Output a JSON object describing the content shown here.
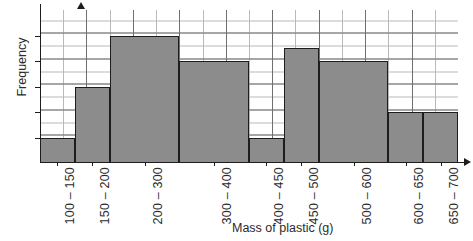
{
  "chart_data": {
    "type": "bar",
    "title": "",
    "subtitle": "",
    "xlabel": "Mass of plastic (g)",
    "ylabel": "Frequency",
    "categories": [
      "100 – 150",
      "150 – 200",
      "200 – 300",
      "300 – 400",
      "400 – 450",
      "450 – 500",
      "500 – 600",
      "600 – 650",
      "650 – 700"
    ],
    "values": [
      1,
      3,
      5,
      4,
      1,
      4.5,
      4,
      2,
      2
    ],
    "bin_edges": [
      100,
      150,
      200,
      300,
      400,
      450,
      500,
      600,
      650,
      700
    ],
    "bin_widths": [
      50,
      50,
      100,
      100,
      50,
      50,
      100,
      50,
      50
    ],
    "xlim": [
      100,
      700
    ],
    "ylim": [
      0,
      6
    ],
    "y_ticks": [
      1,
      2,
      3,
      4,
      5
    ],
    "y_tick_labels": [
      "1",
      "2",
      "3",
      "4",
      "5"
    ],
    "y_minor_step": 0.5,
    "x_minor_step": 25,
    "grid": true,
    "legend": false,
    "legend_position": "none",
    "bar_fill_color": "#8c8c8c",
    "bar_edge_color": "#1d1d1d",
    "grid_major_color": "#6f6f6f",
    "grid_minor_color": "#b9b9b9",
    "axis_color": "#1d1d1d",
    "background_color": "#ffffff"
  }
}
